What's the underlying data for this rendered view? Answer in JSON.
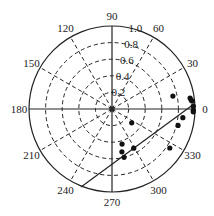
{
  "chart_data": {
    "type": "scatter",
    "subtype": "polar",
    "title": "",
    "center_px": [
      112,
      109
    ],
    "radius_px": 83,
    "radial_axis": {
      "range": [
        0,
        1.0
      ],
      "ticks": [
        0.2,
        0.4,
        0.6,
        0.8,
        1.0
      ],
      "tick_labels": [
        "0.2",
        "0.4",
        "0.6",
        "0.8",
        "1.0"
      ],
      "label_angle_deg": 75
    },
    "angular_axis": {
      "unit": "degrees",
      "direction": "counterclockwise",
      "zero_at": "east",
      "ticks": [
        0,
        30,
        60,
        90,
        120,
        150,
        180,
        210,
        240,
        270,
        300,
        330
      ],
      "tick_labels": [
        "0",
        "30",
        "60",
        "90",
        "120",
        "150",
        "180",
        "210",
        "240",
        "270",
        "300",
        "330"
      ]
    },
    "grid": {
      "circles": "dashed",
      "spokes": "dashed",
      "axes_0_90_180_270": "solid"
    },
    "series": [
      {
        "name": "observations",
        "marker": "filled-circle",
        "color": "#111111",
        "points": [
          {
            "theta": 12,
            "r": 0.75
          },
          {
            "theta": 8,
            "r": 0.95
          },
          {
            "theta": 6.5,
            "r": 0.96
          },
          {
            "theta": 5.7,
            "r": 0.97
          },
          {
            "theta": 2,
            "r": 0.98
          },
          {
            "theta": 359,
            "r": 0.98
          },
          {
            "theta": 358,
            "r": 0.98
          },
          {
            "theta": 353,
            "r": 0.86
          },
          {
            "theta": 346,
            "r": 0.82
          },
          {
            "theta": 326,
            "r": 0.84
          },
          {
            "theta": 325,
            "r": 0.29
          },
          {
            "theta": 299,
            "r": 0.54
          },
          {
            "theta": 286,
            "r": 0.44
          },
          {
            "theta": 283,
            "r": 0.53
          },
          {
            "theta": 284,
            "r": 0.6
          }
        ]
      }
    ],
    "annotations": [
      {
        "type": "line",
        "from_px": [
          81,
          187
        ],
        "to_px": [
          194,
          104
        ],
        "description": "solid straight line crossing plot from ~240° edge to near 0° edge"
      }
    ],
    "legend": null
  }
}
